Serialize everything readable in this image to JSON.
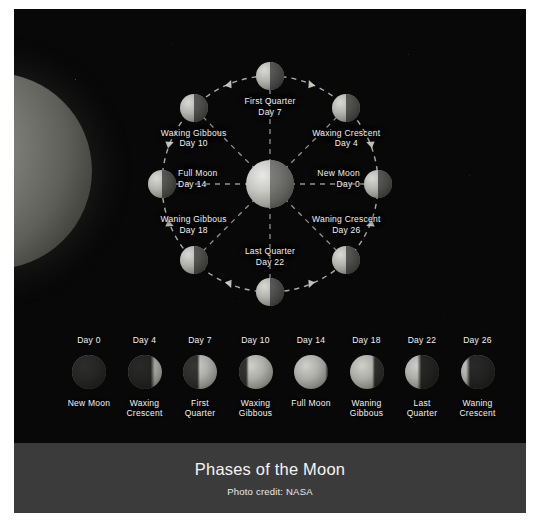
{
  "poster": {
    "background_color": "#080808",
    "caption": {
      "title": "Phases of the Moon",
      "credit": "Photo credit: NASA",
      "band_color": "#3b3b3b"
    }
  },
  "diagram": {
    "sun_name": "sun",
    "earth_name": "earth",
    "orbit_style": "dashed",
    "moons": [
      {
        "name": "New Moon",
        "day": "Day 0",
        "angle_deg": 180,
        "illum": 0.0,
        "lit_side": "left"
      },
      {
        "name": "Waxing Crescent",
        "day": "Day 4",
        "angle_deg": 135,
        "illum": 0.15,
        "lit_side": "left"
      },
      {
        "name": "First Quarter",
        "day": "Day 7",
        "angle_deg": 90,
        "illum": 0.5,
        "lit_side": "left"
      },
      {
        "name": "Waxing Gibbous",
        "day": "Day 10",
        "angle_deg": 45,
        "illum": 0.85,
        "lit_side": "left"
      },
      {
        "name": "Full Moon",
        "day": "Day 14",
        "angle_deg": 0,
        "illum": 1.0,
        "lit_side": "left"
      },
      {
        "name": "Waning Gibbous",
        "day": "Day 18",
        "angle_deg": 315,
        "illum": 0.85,
        "lit_side": "left"
      },
      {
        "name": "Last Quarter",
        "day": "Day 22",
        "angle_deg": 270,
        "illum": 0.5,
        "lit_side": "left"
      },
      {
        "name": "Waning Crescent",
        "day": "Day 26",
        "angle_deg": 225,
        "illum": 0.15,
        "lit_side": "left"
      }
    ]
  },
  "strip": {
    "cells": [
      {
        "day": "Day 0",
        "line1": "New Moon",
        "line2": "",
        "phase": 0.0
      },
      {
        "day": "Day 4",
        "line1": "Waxing",
        "line2": "Crescent",
        "phase": 0.14
      },
      {
        "day": "Day 7",
        "line1": "First",
        "line2": "Quarter",
        "phase": 0.25
      },
      {
        "day": "Day 10",
        "line1": "Waxing",
        "line2": "Gibbous",
        "phase": 0.36
      },
      {
        "day": "Day 14",
        "line1": "Full Moon",
        "line2": "",
        "phase": 0.5
      },
      {
        "day": "Day 18",
        "line1": "Waning",
        "line2": "Gibbous",
        "phase": 0.64
      },
      {
        "day": "Day 22",
        "line1": "Last",
        "line2": "Quarter",
        "phase": 0.75
      },
      {
        "day": "Day 26",
        "line1": "Waning",
        "line2": "Crescent",
        "phase": 0.89
      }
    ]
  },
  "chart_data": {
    "type": "diagram",
    "title": "Phases of the Moon",
    "subtitle": "Photo credit: NASA",
    "cycle_days": 28,
    "categories": [
      "New Moon",
      "Waxing Crescent",
      "First Quarter",
      "Waxing Gibbous",
      "Full Moon",
      "Waning Gibbous",
      "Last Quarter",
      "Waning Crescent"
    ],
    "days": [
      0,
      4,
      7,
      10,
      14,
      18,
      22,
      26
    ],
    "illuminated_fraction": [
      0.0,
      0.15,
      0.5,
      0.85,
      1.0,
      0.85,
      0.5,
      0.15
    ],
    "orbit_angles_deg": [
      180,
      135,
      90,
      45,
      0,
      315,
      270,
      225
    ],
    "legend": "none",
    "grid": false
  }
}
